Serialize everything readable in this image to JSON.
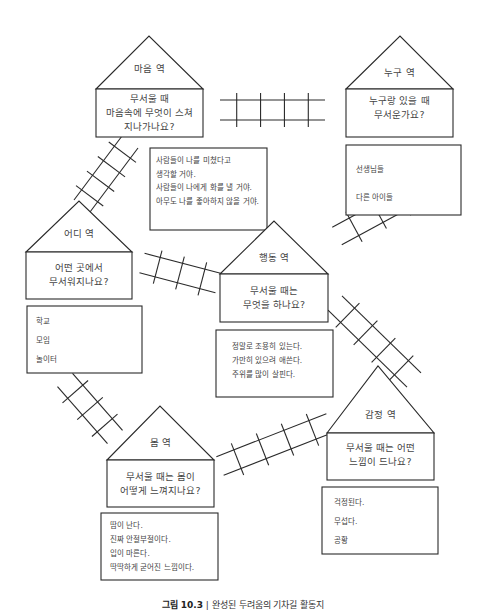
{
  "stations": [
    {
      "id": "mind",
      "name": "마음 역",
      "question": [
        "무서울 때",
        "마음속에 무엇이 스쳐",
        "지나가나요?"
      ],
      "answers": [
        "사람들이 나를 미쳤다고",
        "생각할 거야.",
        "사람들이 나에게 화를 낼 거야.",
        "아무도 나를 좋아하지 않을 거야."
      ]
    },
    {
      "id": "who",
      "name": "누구 역",
      "question": [
        "누구랑 있을 때",
        "무서운가요?"
      ],
      "answers": [
        "선생님들",
        "다른 아이들"
      ]
    },
    {
      "id": "where",
      "name": "어디 역",
      "question": [
        "어떤 곳에서",
        "무서워지나요?"
      ],
      "answers": [
        "학교",
        "모임",
        "놀이터"
      ]
    },
    {
      "id": "behavior",
      "name": "행동 역",
      "question": [
        "무서울 때는",
        "무엇을 하나요?"
      ],
      "answers": [
        "정말로 조용히 있는다.",
        "가만히 있으려 애쓴다.",
        "주위를 많이 살핀다."
      ]
    },
    {
      "id": "body",
      "name": "몸 역",
      "question": [
        "무서울 때는 몸이",
        "어떻게 느껴지나요?"
      ],
      "answers": [
        "땀이 난다.",
        "진짜 안절부절이다.",
        "입이 마른다.",
        "딱딱하게 굳어진 느낌이다."
      ]
    },
    {
      "id": "feeling",
      "name": "감정 역",
      "question": [
        "무서울 때는 어떤",
        "느낌이 드나요?"
      ],
      "answers": [
        "걱정된다.",
        "무섭다.",
        "공황"
      ]
    }
  ],
  "tracks": [
    {
      "from": "mind",
      "to": "who"
    },
    {
      "from": "mind",
      "to": "where"
    },
    {
      "from": "where",
      "to": "behavior"
    },
    {
      "from": "behavior",
      "to": "who"
    },
    {
      "from": "behavior",
      "to": "feeling"
    },
    {
      "from": "where",
      "to": "body"
    },
    {
      "from": "body",
      "to": "feeling"
    }
  ],
  "caption": {
    "label": "그림 10.3",
    "separator": "|",
    "text": "완성된 두려움의 기차길 활동지"
  },
  "colors": {
    "line": "#2a2a2a",
    "text": "#444444"
  }
}
